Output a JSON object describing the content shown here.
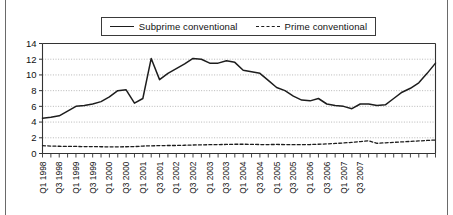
{
  "chart_data": {
    "type": "line",
    "title": "",
    "subtitle": "",
    "xlabel": "",
    "ylabel": "",
    "ylim": [
      0,
      14
    ],
    "yticks": [
      0,
      2,
      4,
      6,
      8,
      10,
      12,
      14
    ],
    "ytick_labels": [
      "0",
      "2",
      "4",
      "6",
      "8",
      "10",
      "12",
      "14"
    ],
    "grid": true,
    "grid_style": "dotted horizontal",
    "legend_position": "top-center",
    "x": [
      "Q1 1998",
      "Q2 1998",
      "Q3 1998",
      "Q4 1998",
      "Q1 1999",
      "Q2 1999",
      "Q3 1999",
      "Q4 1999",
      "Q1 2000",
      "Q2 2000",
      "Q3 2000",
      "Q4 2000",
      "Q1 2001",
      "Q2 2001",
      "Q3 2001",
      "Q4 2001",
      "Q1 2002",
      "Q2 2002",
      "Q3 2002",
      "Q4 2002",
      "Q1 2003",
      "Q2 2003",
      "Q3 2003",
      "Q4 2003",
      "Q1 2004",
      "Q2 2004",
      "Q3 2004",
      "Q4 2004",
      "Q1 2005",
      "Q2 2005",
      "Q3 2005",
      "Q4 2005",
      "Q1 2006",
      "Q2 2006",
      "Q3 2006",
      "Q4 2006",
      "Q1 2007",
      "Q2 2007",
      "Q3 2007",
      "Q4 2007"
    ],
    "xtick_labels": [
      "Q1 1998",
      "Q3 1998",
      "Q1 1999",
      "Q3 1999",
      "Q1 2000",
      "Q3 2000",
      "Q1 2001",
      "Q3 2001",
      "Q1 2002",
      "Q3 2002",
      "Q1 2003",
      "Q3 2003",
      "Q1 2004",
      "Q3 2004",
      "Q1 2005",
      "Q3 2005",
      "Q1 2006",
      "Q3 2006",
      "Q1 2007",
      "Q3 2007"
    ],
    "xtick_rotation": 90,
    "series": [
      {
        "name": "Subprime conventional",
        "style": "solid",
        "color": "#1d1d1d",
        "values": [
          4.5,
          4.6,
          4.8,
          5.4,
          6.0,
          6.1,
          6.3,
          6.6,
          7.2,
          8.0,
          8.1,
          6.4,
          7.0,
          12.1,
          9.4,
          10.2,
          10.8,
          11.4,
          12.1,
          12.0,
          11.5,
          11.5,
          11.8,
          11.6,
          10.6,
          10.4,
          10.2,
          9.3,
          8.4,
          8.0,
          7.3,
          6.8,
          6.7,
          7.0,
          6.3,
          6.1,
          6.0,
          5.7,
          6.3,
          6.3
        ]
      },
      {
        "name": "Prime conventional",
        "style": "dashed",
        "color": "#1d1d1d",
        "values": [
          1.0,
          0.95,
          0.92,
          0.9,
          0.9,
          0.88,
          0.88,
          0.86,
          0.85,
          0.85,
          0.86,
          0.88,
          0.95,
          0.98,
          1.0,
          1.02,
          1.02,
          1.05,
          1.08,
          1.1,
          1.12,
          1.14,
          1.15,
          1.18,
          1.18,
          1.16,
          1.14,
          1.14,
          1.15,
          1.14,
          1.12,
          1.12,
          1.14,
          1.18,
          1.22,
          1.28,
          1.34,
          1.42,
          1.52,
          1.62
        ]
      }
    ],
    "series_extra_tail": {
      "Subprime conventional": [
        6.1,
        6.2,
        7.0,
        7.8,
        8.3,
        9.0,
        10.2,
        11.5
      ],
      "Prime conventional": [
        1.3,
        1.36,
        1.42,
        1.48,
        1.54,
        1.6,
        1.66,
        1.72
      ]
    }
  },
  "legend": {
    "items": [
      {
        "label": "Subprime conventional",
        "style": "solid"
      },
      {
        "label": "Prime conventional",
        "style": "dashed"
      }
    ]
  }
}
